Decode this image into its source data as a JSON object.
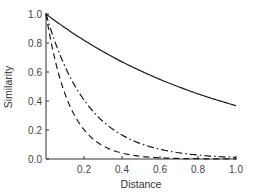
{
  "chart_data": {
    "type": "line",
    "title": "",
    "xlabel": "Distance",
    "ylabel": "Similarity",
    "xlim": [
      0,
      1.0
    ],
    "ylim": [
      0,
      1.0
    ],
    "grid": false,
    "legend": null,
    "x_ticks": [
      0.2,
      0.4,
      0.6,
      0.8,
      1.0
    ],
    "x_tick_labels": [
      "0.2",
      "0.4",
      "0.6",
      "0.8",
      "1.0"
    ],
    "y_ticks": [
      0.0,
      0.2,
      0.4,
      0.6,
      0.8,
      1.0
    ],
    "y_tick_labels": [
      "0.0",
      "0.2",
      "0.4",
      "0.6",
      "0.8",
      "1.0"
    ],
    "x": [
      0.0,
      0.1,
      0.2,
      0.3,
      0.4,
      0.5,
      0.6,
      0.7,
      0.8,
      0.9,
      1.0
    ],
    "series": [
      {
        "name": "solid",
        "style": "solid",
        "values": [
          1.0,
          0.905,
          0.819,
          0.741,
          0.67,
          0.607,
          0.549,
          0.497,
          0.449,
          0.407,
          0.368
        ]
      },
      {
        "name": "dash-dot",
        "style": "dashdot",
        "values": [
          1.0,
          0.638,
          0.407,
          0.259,
          0.165,
          0.105,
          0.067,
          0.043,
          0.027,
          0.017,
          0.011
        ]
      },
      {
        "name": "dashed",
        "style": "dashed",
        "values": [
          1.0,
          0.449,
          0.202,
          0.091,
          0.041,
          0.018,
          0.008,
          0.004,
          0.002,
          0.001,
          0.0
        ]
      }
    ]
  },
  "colors": {
    "line": "#1a1a1a",
    "axis": "#333333"
  }
}
